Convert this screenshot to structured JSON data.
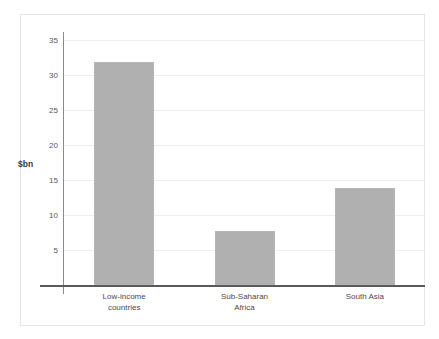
{
  "chart_data": {
    "type": "bar",
    "title": "",
    "subtitle": "",
    "xlabel": "",
    "ylabel": "$bn",
    "categories": [
      "Low-income\ncountries",
      "Sub-Saharan\nAfrica",
      "South Asia"
    ],
    "category_labels_flat": [
      "Low-income countries",
      "Sub-Saharan Africa",
      "South Asia"
    ],
    "values": [
      31.8,
      7.7,
      13.8
    ],
    "ylim": [
      0,
      35
    ],
    "ytick_values": [
      5,
      10,
      15,
      20,
      25,
      30,
      35
    ],
    "ytick_labels": [
      "5",
      "10",
      "15",
      "20",
      "25",
      "30",
      "35"
    ],
    "grid": true,
    "legend": false,
    "legend_position": "none",
    "bar_color": "#b0b0b0",
    "gridline_color": "#eeeeee",
    "axis_color": "#8a8a8a",
    "baseline_color": "#5a5a5a",
    "frame_color": "#e6e6e6",
    "background_color": "#ffffff",
    "text_color": "#4a4a4a"
  }
}
